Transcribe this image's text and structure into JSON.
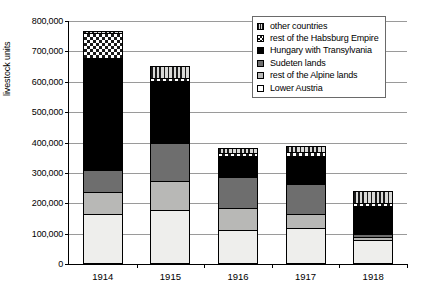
{
  "chart_data": {
    "type": "bar",
    "subtype": "stacked-bar",
    "title": "",
    "xlabel": "",
    "ylabel": "livestock units",
    "ylim": [
      0,
      800000
    ],
    "ytick_step": 100000,
    "ytick_labels": [
      "800,000",
      "700,000",
      "600,000",
      "500,000",
      "400,000",
      "300,000",
      "200,000",
      "100,000",
      "0"
    ],
    "ytick_values": [
      800000,
      700000,
      600000,
      500000,
      400000,
      300000,
      200000,
      100000,
      0
    ],
    "grid": true,
    "grid_axis": "y",
    "legend_position": "top-right",
    "categories": [
      "1914",
      "1915",
      "1916",
      "1917",
      "1918"
    ],
    "stack_order_bottom_to_top": [
      "Lower Austria",
      "rest of the Alpine lands",
      "Sudeten lands",
      "Hungary with Transylvania",
      "rest of the Habsburg Empire",
      "other countries"
    ],
    "series": [
      {
        "name": "Lower Austria",
        "pattern": "white",
        "color": "#eeeeec",
        "values": [
          165000,
          178000,
          113000,
          120000,
          80000
        ]
      },
      {
        "name": "rest of the Alpine lands",
        "pattern": "light-gray",
        "color": "#b8b8b6",
        "values": [
          72000,
          95000,
          72000,
          45000,
          10000
        ]
      },
      {
        "name": "Sudeten lands",
        "pattern": "dark-gray",
        "color": "#6e6e6e",
        "values": [
          72000,
          125000,
          100000,
          98000,
          10000
        ]
      },
      {
        "name": "Hungary with Transylvania",
        "pattern": "solid-black",
        "color": "#000000",
        "values": [
          368000,
          205000,
          72000,
          93000,
          90000
        ]
      },
      {
        "name": "rest of the Habsburg Empire",
        "pattern": "checkerboard",
        "color": "#ffffff",
        "values": [
          85000,
          10000,
          10000,
          12000,
          12000
        ]
      },
      {
        "name": "other countries",
        "pattern": "vertical-stripes",
        "color": "#d9d9d7",
        "values": [
          5000,
          40000,
          15000,
          20000,
          38000
        ]
      }
    ],
    "totals": [
      767000,
      653000,
      382000,
      388000,
      240000
    ]
  },
  "legend": {
    "items": [
      {
        "label": "other countries",
        "swatch": "vertical-stripes-swatch"
      },
      {
        "label": "rest of the Habsburg Empire",
        "swatch": "checkerboard-swatch"
      },
      {
        "label": "Hungary with Transylvania",
        "swatch": "solid-black-swatch"
      },
      {
        "label": "Sudeten lands",
        "swatch": "dark-gray-swatch"
      },
      {
        "label": "rest of the Alpine lands",
        "swatch": "light-gray-swatch"
      },
      {
        "label": "Lower Austria",
        "swatch": "white-swatch"
      }
    ]
  }
}
